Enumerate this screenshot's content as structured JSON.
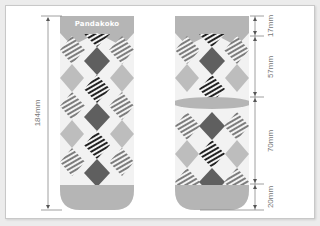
{
  "figure": {
    "brand_label": "Pandakoko",
    "colors": {
      "cuff": "#b5b5b5",
      "diamond_light": "#bdbdbd",
      "diamond_dark": "#5f5f5f",
      "stripe_dark": "#222222",
      "stripe_mid": "#7a7a7a",
      "background_pattern": "#f2f2f2",
      "dimension_line": "#888888",
      "text": "#777777"
    },
    "left_sock": {
      "total_length": "184mm"
    },
    "right_sock": {
      "segments": [
        {
          "name": "cuff",
          "label": "17mm"
        },
        {
          "name": "leg",
          "label": "57mm"
        },
        {
          "name": "foot",
          "label": "70mm"
        },
        {
          "name": "toe",
          "label": "20mm"
        }
      ]
    }
  }
}
